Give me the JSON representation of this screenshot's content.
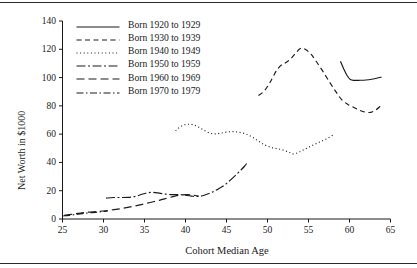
{
  "chart_data": {
    "type": "line",
    "title": "",
    "xlabel": "Cohort Median Age",
    "ylabel": "Net Worth in $1000",
    "xlim": [
      25,
      65
    ],
    "ylim": [
      0,
      140
    ],
    "xticks": [
      25,
      30,
      35,
      40,
      45,
      50,
      55,
      60,
      65
    ],
    "yticks": [
      0,
      20,
      40,
      60,
      80,
      100,
      120,
      140
    ],
    "grid": false,
    "legend_position": "top-left",
    "line_color": "#1a1a1a",
    "series": [
      {
        "name": "Born 1920 to 1929",
        "style": "solid",
        "dash": "none",
        "points": [
          [
            58.9,
            111.5
          ],
          [
            59.3,
            106.0
          ],
          [
            59.7,
            101.5
          ],
          [
            60.1,
            98.6
          ],
          [
            60.6,
            98.0
          ],
          [
            61.3,
            98.1
          ],
          [
            62.0,
            98.3
          ],
          [
            62.7,
            98.8
          ],
          [
            63.3,
            99.5
          ],
          [
            63.9,
            100.3
          ]
        ]
      },
      {
        "name": "Born 1930 to 1939",
        "style": "dashed",
        "dash": "5,3.5",
        "points": [
          [
            48.9,
            87.3
          ],
          [
            49.6,
            90.5
          ],
          [
            50.3,
            96.5
          ],
          [
            51.0,
            104.0
          ],
          [
            51.6,
            108.5
          ],
          [
            52.2,
            110.5
          ],
          [
            52.8,
            113.0
          ],
          [
            53.4,
            117.0
          ],
          [
            54.0,
            120.5
          ],
          [
            54.6,
            120.0
          ],
          [
            55.3,
            116.5
          ],
          [
            56.0,
            111.0
          ],
          [
            56.8,
            104.0
          ],
          [
            57.6,
            96.5
          ],
          [
            58.4,
            89.5
          ],
          [
            59.1,
            84.0
          ],
          [
            59.8,
            81.0
          ],
          [
            60.5,
            79.0
          ],
          [
            61.2,
            77.0
          ],
          [
            61.9,
            75.6
          ],
          [
            62.6,
            75.4
          ],
          [
            63.2,
            77.0
          ],
          [
            63.8,
            80.0
          ]
        ]
      },
      {
        "name": "Born 1940 to 1949",
        "style": "dotted",
        "dash": "1,2.6",
        "points": [
          [
            38.8,
            62.3
          ],
          [
            39.2,
            64.5
          ],
          [
            39.7,
            66.3
          ],
          [
            40.3,
            67.0
          ],
          [
            40.9,
            66.7
          ],
          [
            41.6,
            65.0
          ],
          [
            42.3,
            62.6
          ],
          [
            43.0,
            60.6
          ],
          [
            43.7,
            60.2
          ],
          [
            44.4,
            60.8
          ],
          [
            45.1,
            61.5
          ],
          [
            45.8,
            61.8
          ],
          [
            46.5,
            61.3
          ],
          [
            47.3,
            60.3
          ],
          [
            48.1,
            58.0
          ],
          [
            48.9,
            55.0
          ],
          [
            49.7,
            52.3
          ],
          [
            50.5,
            50.5
          ],
          [
            51.3,
            49.6
          ],
          [
            52.0,
            48.6
          ],
          [
            52.7,
            47.0
          ],
          [
            53.2,
            46.0
          ],
          [
            53.9,
            47.5
          ],
          [
            54.6,
            49.5
          ],
          [
            55.3,
            51.5
          ],
          [
            56.0,
            53.5
          ],
          [
            56.7,
            55.3
          ],
          [
            57.4,
            57.3
          ],
          [
            58.0,
            59.5
          ]
        ]
      },
      {
        "name": "Born 1950 to 1959",
        "style": "dash-dot-dash",
        "dash": "9,2.5,2,2.5",
        "points": [
          [
            30.3,
            14.8
          ],
          [
            31.2,
            15.2
          ],
          [
            32.1,
            15.2
          ],
          [
            33.0,
            15.3
          ],
          [
            33.9,
            16.0
          ],
          [
            34.6,
            17.3
          ],
          [
            35.3,
            18.5
          ],
          [
            36.0,
            18.8
          ],
          [
            36.8,
            18.3
          ],
          [
            37.6,
            17.6
          ],
          [
            38.4,
            17.2
          ],
          [
            39.2,
            17.3
          ],
          [
            39.9,
            16.8
          ],
          [
            40.7,
            16.2
          ],
          [
            41.4,
            15.9
          ],
          [
            42.2,
            16.6
          ],
          [
            43.0,
            18.3
          ],
          [
            43.8,
            20.6
          ],
          [
            44.6,
            23.3
          ],
          [
            45.3,
            26.6
          ],
          [
            46.0,
            30.3
          ],
          [
            46.7,
            34.3
          ],
          [
            47.2,
            37.3
          ],
          [
            47.6,
            40.3
          ]
        ]
      },
      {
        "name": "Born 1960 to 1969",
        "style": "long-dash",
        "dash": "8,4",
        "points": [
          [
            25.2,
            2.6
          ],
          [
            26.2,
            3.4
          ],
          [
            27.2,
            4.2
          ],
          [
            28.2,
            4.9
          ],
          [
            29.2,
            5.3
          ],
          [
            30.2,
            5.8
          ],
          [
            31.3,
            6.6
          ],
          [
            32.4,
            7.6
          ],
          [
            33.5,
            8.8
          ],
          [
            34.6,
            10.2
          ],
          [
            35.7,
            11.7
          ],
          [
            36.8,
            13.2
          ],
          [
            37.8,
            14.8
          ],
          [
            38.7,
            16.2
          ],
          [
            39.5,
            17.0
          ],
          [
            40.2,
            17.2
          ],
          [
            40.9,
            16.8
          ],
          [
            41.6,
            16.3
          ]
        ]
      },
      {
        "name": "Born 1970 to 1979",
        "style": "dash-dot",
        "dash": "7,2.5,1.5,2.5",
        "points": [
          [
            25.1,
            2.2
          ],
          [
            25.8,
            2.6
          ],
          [
            26.6,
            3.2
          ],
          [
            27.4,
            3.8
          ],
          [
            28.2,
            4.3
          ],
          [
            29.0,
            4.7
          ],
          [
            29.8,
            5.2
          ],
          [
            30.5,
            5.6
          ]
        ]
      }
    ]
  },
  "axes": {
    "ylabel": "Net Worth in $1000",
    "xlabel": "Cohort Median Age",
    "ytick_labels": [
      "0",
      "20",
      "40",
      "60",
      "80",
      "100",
      "120",
      "140"
    ],
    "xtick_labels": [
      "25",
      "30",
      "35",
      "40",
      "45",
      "50",
      "55",
      "60",
      "65"
    ]
  },
  "legend": {
    "items": [
      {
        "label": "Born 1920 to 1929"
      },
      {
        "label": "Born 1930 to 1939"
      },
      {
        "label": "Born 1940 to 1949"
      },
      {
        "label": "Born 1950 to 1959"
      },
      {
        "label": "Born 1960 to 1969"
      },
      {
        "label": "Born 1970 to 1979"
      }
    ]
  }
}
